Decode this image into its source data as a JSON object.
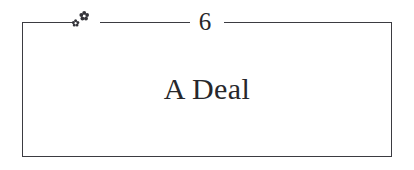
{
  "page": {
    "type": "book-chapter-heading",
    "background_color": "#ffffff",
    "ink_color": "#3b3b41"
  },
  "heading": {
    "chapter_number": "6",
    "chapter_title": "A Deal",
    "ornament_name": "floret-ornament",
    "ornament_glyph_large": "❀",
    "ornament_glyph_small": "❀"
  },
  "frame": {
    "border_color": "#3b3b41",
    "top_rule_segments": [
      "left",
      "middle",
      "right"
    ]
  }
}
